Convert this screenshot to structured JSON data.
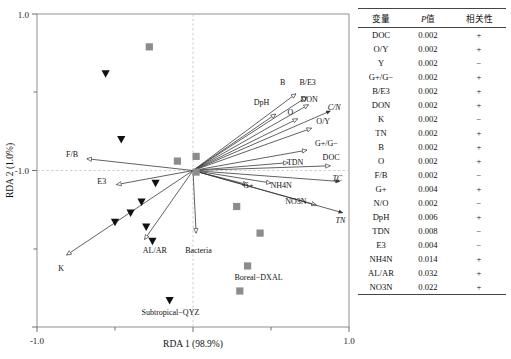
{
  "chart_data": {
    "type": "scatter",
    "title": "",
    "xlabel": "RDA 1 (98.9%)",
    "ylabel": "RDA 2 (1.0%)",
    "xlim": [
      -1.0,
      1.0
    ],
    "ylim": [
      -1.0,
      1.0
    ],
    "xticks": [
      "-1.0",
      "1.0"
    ],
    "yticks": [
      "1.0",
      "-1.0"
    ],
    "grid": false,
    "zero_lines": true,
    "legend": "none",
    "series": [
      {
        "name": "square-samples",
        "marker": "square",
        "color": "#8c8c8c",
        "points": [
          {
            "x": -0.28,
            "y": 0.79
          },
          {
            "x": -0.1,
            "y": 0.06
          },
          {
            "x": 0.02,
            "y": 0.09
          },
          {
            "x": 0.02,
            "y": -0.01
          },
          {
            "x": 0.28,
            "y": -0.23
          },
          {
            "x": 0.43,
            "y": -0.4
          },
          {
            "x": 0.35,
            "y": -0.61
          },
          {
            "x": 0.3,
            "y": -0.77
          }
        ]
      },
      {
        "name": "triangle-samples",
        "marker": "triangle-down",
        "color": "#111111",
        "points": [
          {
            "x": -0.56,
            "y": 0.62
          },
          {
            "x": -0.46,
            "y": 0.2
          },
          {
            "x": -0.24,
            "y": -0.08
          },
          {
            "x": -0.33,
            "y": -0.2
          },
          {
            "x": -0.4,
            "y": -0.27
          },
          {
            "x": -0.5,
            "y": -0.33
          },
          {
            "x": -0.3,
            "y": -0.36
          },
          {
            "x": -0.26,
            "y": -0.45
          },
          {
            "x": -0.15,
            "y": -0.83
          }
        ]
      }
    ],
    "vectors": [
      {
        "label": "B",
        "tipx": 0.66,
        "tipy": 0.49,
        "lx": 0.575,
        "ly": 0.565,
        "italic": false,
        "tip": "open"
      },
      {
        "label": "B/E3",
        "tipx": 0.73,
        "tipy": 0.47,
        "lx": 0.735,
        "ly": 0.565,
        "italic": false,
        "tip": "open"
      },
      {
        "label": "DON",
        "tipx": 0.74,
        "tipy": 0.42,
        "lx": 0.745,
        "ly": 0.455,
        "italic": false,
        "tip": "open"
      },
      {
        "label": "C/N",
        "tipx": 0.88,
        "tipy": 0.38,
        "lx": 0.905,
        "ly": 0.405,
        "italic": true,
        "tip": "filled"
      },
      {
        "label": "DpH",
        "tipx": 0.53,
        "tipy": 0.36,
        "lx": 0.44,
        "ly": 0.435,
        "italic": false,
        "tip": "open"
      },
      {
        "label": "O",
        "tipx": 0.67,
        "tipy": 0.33,
        "lx": 0.625,
        "ly": 0.375,
        "italic": false,
        "tip": "open"
      },
      {
        "label": "O/Y",
        "tipx": 0.76,
        "tipy": 0.27,
        "lx": 0.835,
        "ly": 0.315,
        "italic": false,
        "tip": "open"
      },
      {
        "label": "G+/G−",
        "tipx": 0.73,
        "tipy": 0.13,
        "lx": 0.855,
        "ly": 0.175,
        "italic": false,
        "tip": "open"
      },
      {
        "label": "TDN",
        "tipx": 0.61,
        "tipy": 0.05,
        "lx": 0.655,
        "ly": 0.055,
        "italic": false,
        "tip": "open"
      },
      {
        "label": "DOC",
        "tipx": 0.88,
        "tipy": 0.03,
        "lx": 0.885,
        "ly": 0.085,
        "italic": false,
        "tip": "open"
      },
      {
        "label": "TC",
        "tipx": 0.94,
        "tipy": -0.07,
        "lx": 0.925,
        "ly": -0.045,
        "italic": true,
        "tip": "filled"
      },
      {
        "label": "NH4N",
        "tipx": 0.5,
        "tipy": -0.08,
        "lx": 0.565,
        "ly": -0.095,
        "italic": false,
        "tip": "open"
      },
      {
        "label": "G+",
        "tipx": 0.35,
        "tipy": -0.09,
        "lx": 0.355,
        "ly": -0.095,
        "italic": false,
        "tip": "open"
      },
      {
        "label": "NO3N",
        "tipx": 0.79,
        "tipy": -0.22,
        "lx": 0.66,
        "ly": -0.195,
        "italic": false,
        "tip": "open"
      },
      {
        "label": "TN",
        "tipx": 0.96,
        "tipy": -0.27,
        "lx": 0.945,
        "ly": -0.315,
        "italic": true,
        "tip": "filled"
      },
      {
        "label": "F/B",
        "tipx": -0.68,
        "tipy": 0.075,
        "lx": -0.775,
        "ly": 0.105,
        "italic": false,
        "tip": "open"
      },
      {
        "label": "E3",
        "tipx": -0.49,
        "tipy": -0.09,
        "lx": -0.585,
        "ly": -0.065,
        "italic": false,
        "tip": "open"
      },
      {
        "label": "AL/AR",
        "tipx": -0.31,
        "tipy": -0.44,
        "lx": -0.245,
        "ly": -0.505,
        "italic": false,
        "tip": "open"
      },
      {
        "label": "K",
        "tipx": -0.81,
        "tipy": -0.54,
        "lx": -0.845,
        "ly": -0.625,
        "italic": false,
        "tip": "open"
      },
      {
        "label": "Bacteria",
        "tipx": 0.02,
        "tipy": -0.4,
        "lx": 0.035,
        "ly": -0.505,
        "italic": false,
        "tip": "open"
      }
    ],
    "site_labels": [
      {
        "text": "Boreal−DXAL",
        "x": 0.42,
        "y": -0.68
      },
      {
        "text": "Subtropical−QYZ",
        "x": -0.145,
        "y": -0.905
      }
    ]
  },
  "table": {
    "headers": [
      "变量",
      "P值",
      "相关性"
    ],
    "header_p_italic": "P",
    "header_p_rest": "值",
    "rows": [
      {
        "variable": "DOC",
        "p": "0.002",
        "corr": "+"
      },
      {
        "variable": "O/Y",
        "p": "0.002",
        "corr": "+"
      },
      {
        "variable": "Y",
        "p": "0.002",
        "corr": "−"
      },
      {
        "variable": "G+/G−",
        "p": "0.002",
        "corr": "+"
      },
      {
        "variable": "B/E3",
        "p": "0.002",
        "corr": "+"
      },
      {
        "variable": "DON",
        "p": "0.002",
        "corr": "+"
      },
      {
        "variable": "K",
        "p": "0.002",
        "corr": "−"
      },
      {
        "variable": "TN",
        "p": "0.002",
        "corr": "+"
      },
      {
        "variable": "B",
        "p": "0.002",
        "corr": "+"
      },
      {
        "variable": "O",
        "p": "0.002",
        "corr": "+"
      },
      {
        "variable": "F/B",
        "p": "0.002",
        "corr": "−"
      },
      {
        "variable": "G+",
        "p": "0.004",
        "corr": "+"
      },
      {
        "variable": "N/O",
        "p": "0.002",
        "corr": "−"
      },
      {
        "variable": "DpH",
        "p": "0.006",
        "corr": "+"
      },
      {
        "variable": "TDN",
        "p": "0.008",
        "corr": "−"
      },
      {
        "variable": "E3",
        "p": "0.004",
        "corr": "−"
      },
      {
        "variable": "NH4N",
        "p": "0.014",
        "corr": "+"
      },
      {
        "variable": "AL/AR",
        "p": "0.032",
        "corr": "+"
      },
      {
        "variable": "NO3N",
        "p": "0.022",
        "corr": "+"
      }
    ]
  }
}
